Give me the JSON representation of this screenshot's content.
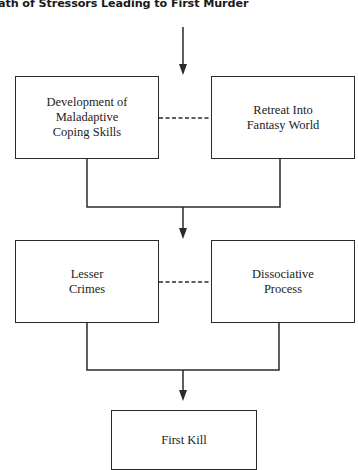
{
  "title": "ath of Stressors Leading to First Murder",
  "nodes": {
    "maladaptive": {
      "lines": [
        "Development of",
        "Maladaptive",
        "Coping Skills"
      ]
    },
    "fantasy": {
      "lines": [
        "Retreat Into",
        "Fantasy World"
      ]
    },
    "lesser_crimes": {
      "lines": [
        "Lesser",
        "Crimes"
      ]
    },
    "dissociative": {
      "lines": [
        "Dissociative",
        "Process"
      ]
    },
    "first_kill": {
      "lines": [
        "First Kill"
      ]
    }
  },
  "edges": [
    {
      "from": "top",
      "to": "maladaptive/fantasy row",
      "type": "arrow"
    },
    {
      "from": "maladaptive",
      "to": "fantasy",
      "type": "dashed"
    },
    {
      "from": "maladaptive+fantasy",
      "to": "lesser_crimes/dissociative row",
      "type": "arrow"
    },
    {
      "from": "lesser_crimes",
      "to": "dissociative",
      "type": "dashed"
    },
    {
      "from": "lesser_crimes+dissociative",
      "to": "first_kill",
      "type": "arrow"
    }
  ],
  "colors": {
    "line": "#2a2a2a",
    "text": "#222222",
    "background": "#ffffff"
  }
}
